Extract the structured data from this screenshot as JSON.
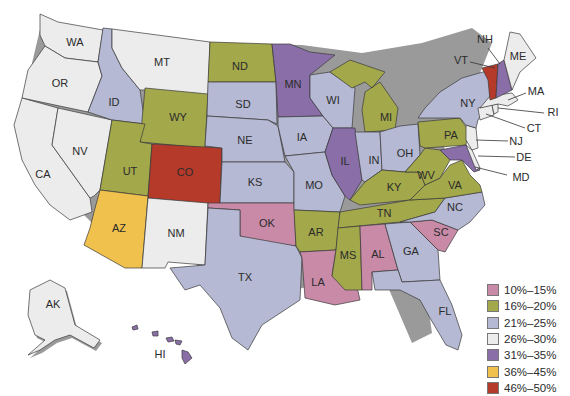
{
  "legend": {
    "items": [
      {
        "label": "10%–15%",
        "color": "#c98aa8"
      },
      {
        "label": "16%–20%",
        "color": "#a3a84a"
      },
      {
        "label": "21%–25%",
        "color": "#b5b9d3"
      },
      {
        "label": "26%–30%",
        "color": "#ececec"
      },
      {
        "label": "31%–35%",
        "color": "#8a6ea8"
      },
      {
        "label": "36%–45%",
        "color": "#f0c14d"
      },
      {
        "label": "46%–50%",
        "color": "#b53a2a"
      }
    ]
  },
  "states": {
    "WA": {
      "label": "WA",
      "category": "26%–30%"
    },
    "OR": {
      "label": "OR",
      "category": "26%–30%"
    },
    "CA": {
      "label": "CA",
      "category": "26%–30%"
    },
    "NV": {
      "label": "NV",
      "category": "26%–30%"
    },
    "ID": {
      "label": "ID",
      "category": "21%–25%"
    },
    "MT": {
      "label": "MT",
      "category": "26%–30%"
    },
    "WY": {
      "label": "WY",
      "category": "16%–20%"
    },
    "UT": {
      "label": "UT",
      "category": "16%–20%"
    },
    "CO": {
      "label": "CO",
      "category": "46%–50%"
    },
    "AZ": {
      "label": "AZ",
      "category": "36%–45%"
    },
    "NM": {
      "label": "NM",
      "category": "26%–30%"
    },
    "ND": {
      "label": "ND",
      "category": "16%–20%"
    },
    "SD": {
      "label": "SD",
      "category": "21%–25%"
    },
    "NE": {
      "label": "NE",
      "category": "21%–25%"
    },
    "KS": {
      "label": "KS",
      "category": "21%–25%"
    },
    "OK": {
      "label": "OK",
      "category": "10%–15%"
    },
    "TX": {
      "label": "TX",
      "category": "21%–25%"
    },
    "MN": {
      "label": "MN",
      "category": "31%–35%"
    },
    "IA": {
      "label": "IA",
      "category": "21%–25%"
    },
    "MO": {
      "label": "MO",
      "category": "21%–25%"
    },
    "AR": {
      "label": "AR",
      "category": "16%–20%"
    },
    "LA": {
      "label": "LA",
      "category": "10%–15%"
    },
    "WI": {
      "label": "WI",
      "category": "21%–25%"
    },
    "IL": {
      "label": "IL",
      "category": "31%–35%"
    },
    "MI": {
      "label": "MI",
      "category": "16%–20%"
    },
    "IN": {
      "label": "IN",
      "category": "21%–25%"
    },
    "OH": {
      "label": "OH",
      "category": "21%–25%"
    },
    "KY": {
      "label": "KY",
      "category": "16%–20%"
    },
    "TN": {
      "label": "TN",
      "category": "16%–20%"
    },
    "MS": {
      "label": "MS",
      "category": "16%–20%"
    },
    "AL": {
      "label": "AL",
      "category": "10%–15%"
    },
    "GA": {
      "label": "GA",
      "category": "21%–25%"
    },
    "FL": {
      "label": "FL",
      "category": "21%–25%"
    },
    "SC": {
      "label": "SC",
      "category": "10%–15%"
    },
    "NC": {
      "label": "NC",
      "category": "21%–25%"
    },
    "VA": {
      "label": "VA",
      "category": "16%–20%"
    },
    "WV": {
      "label": "WV",
      "category": "16%–20%"
    },
    "PA": {
      "label": "PA",
      "category": "16%–20%"
    },
    "NY": {
      "label": "NY",
      "category": "21%–25%"
    },
    "NJ": {
      "label": "NJ",
      "category": "26%–30%"
    },
    "DE": {
      "label": "DE",
      "category": "26%–30%"
    },
    "MD": {
      "label": "MD",
      "category": "31%–35%"
    },
    "VT": {
      "label": "VT",
      "category": "46%–50%"
    },
    "NH": {
      "label": "NH",
      "category": "31%–35%"
    },
    "ME": {
      "label": "ME",
      "category": "26%–30%"
    },
    "MA": {
      "label": "MA",
      "category": "26%–30%"
    },
    "RI": {
      "label": "RI",
      "category": "26%–30%"
    },
    "CT": {
      "label": "CT",
      "category": "26%–30%"
    },
    "AK": {
      "label": "AK",
      "category": "26%–30%"
    },
    "HI": {
      "label": "HI",
      "category": "31%–35%"
    }
  }
}
